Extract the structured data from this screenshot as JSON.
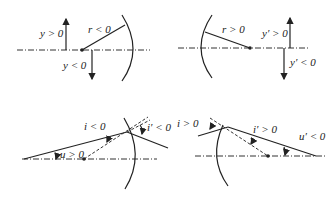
{
  "panels": [
    {
      "id": "object-height-radius",
      "labels": {
        "y_pos": "y > 0",
        "y_neg": "y < 0",
        "radius": "r < 0"
      }
    },
    {
      "id": "image-height-radius",
      "labels": {
        "radius": "r > 0",
        "y_pos": "y′ > 0",
        "y_neg": "y′ < 0"
      }
    },
    {
      "id": "incidence-angles-negative",
      "labels": {
        "i": "i < 0",
        "i_prime": "i′ < 0",
        "u": "u > 0"
      }
    },
    {
      "id": "incidence-angles-positive",
      "labels": {
        "i": "i > 0",
        "i_prime": "i′ > 0",
        "u_prime": "u′ < 0"
      }
    }
  ]
}
